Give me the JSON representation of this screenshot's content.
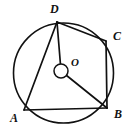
{
  "figure": {
    "type": "geometry-diagram",
    "background_color": "#ffffff",
    "stroke_color": "#111111",
    "labels": {
      "a": "A",
      "b": "B",
      "c": "C",
      "d": "D",
      "o": "O"
    },
    "label_positions": {
      "a": {
        "x": 10,
        "y": 112
      },
      "b": {
        "x": 114,
        "y": 108
      },
      "c": {
        "x": 113,
        "y": 30
      },
      "d": {
        "x": 50,
        "y": 3
      },
      "o": {
        "x": 71,
        "y": 57
      }
    },
    "circle": {
      "cx": 63.5,
      "cy": 73,
      "r": 50,
      "stroke_width": 1.6
    },
    "center_marker": {
      "cx": 61,
      "cy": 71,
      "r": 7,
      "stroke_width": 1.5
    },
    "points": {
      "A": {
        "x": 24,
        "y": 110
      },
      "B": {
        "x": 107,
        "y": 108
      },
      "C": {
        "x": 106,
        "y": 41
      },
      "D": {
        "x": 57,
        "y": 22
      },
      "O": {
        "x": 61,
        "y": 71
      }
    },
    "segments": [
      {
        "name": "side-AB",
        "from": "A",
        "to": "B"
      },
      {
        "name": "side-BC",
        "from": "B",
        "to": "C"
      },
      {
        "name": "side-CD",
        "from": "C",
        "to": "D"
      },
      {
        "name": "side-DA",
        "from": "D",
        "to": "A"
      },
      {
        "name": "radius-OD",
        "from": "O",
        "to": "D"
      },
      {
        "name": "radius-OB",
        "from": "O",
        "to": "B"
      }
    ]
  }
}
